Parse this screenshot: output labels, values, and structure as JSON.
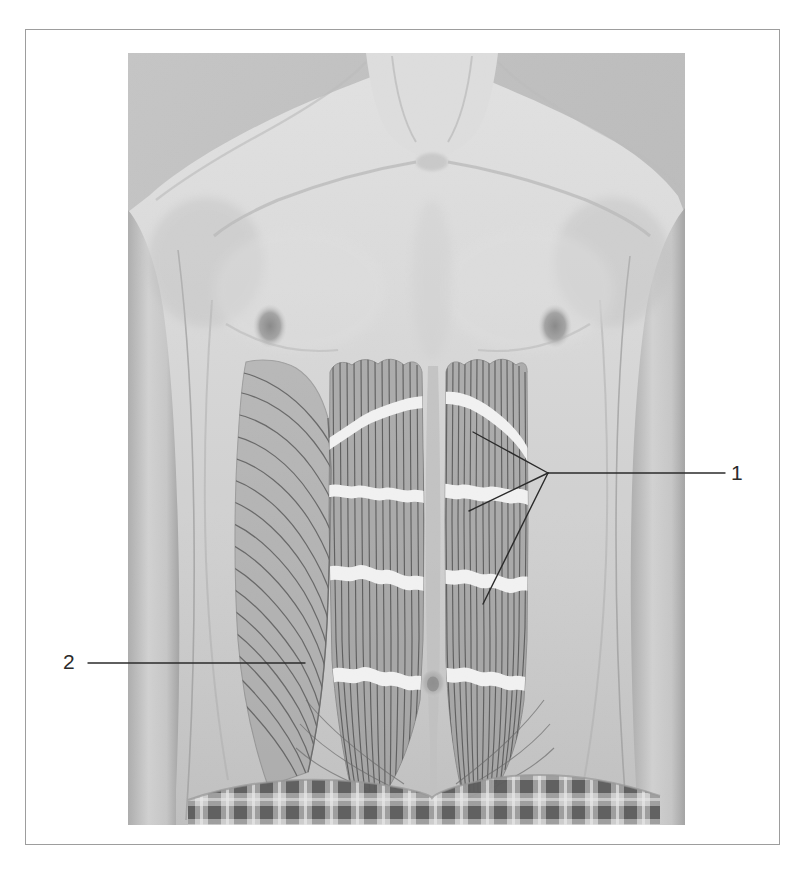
{
  "page": {
    "kind": "anatomy-figure-plate",
    "background_color": "#ffffff",
    "border_color": "#9a9a9a",
    "border": {
      "x": 25,
      "y": 29,
      "width": 755,
      "height": 816
    }
  },
  "photo": {
    "description": "grayscale front view photograph of a male torso from neck to hips",
    "x": 128,
    "y": 53,
    "width": 557,
    "height": 772,
    "background_color": "#c3c3c3",
    "skin_light": "#dcdcdc",
    "skin_mid": "#c8c8c8",
    "skin_shadow": "#a9a9a9",
    "features": [
      {
        "name": "neck",
        "label": "neck"
      },
      {
        "name": "clavicle-left",
        "label": "clavicle"
      },
      {
        "name": "clavicle-right",
        "label": "clavicle"
      },
      {
        "name": "nipple-left",
        "label": "nipple",
        "x": 270,
        "y": 325
      },
      {
        "name": "nipple-right",
        "label": "nipple",
        "x": 555,
        "y": 325
      },
      {
        "name": "umbilicus",
        "label": "navel",
        "x": 432,
        "y": 683
      },
      {
        "name": "plaid-waistband",
        "label": "plaid shorts waistband"
      }
    ]
  },
  "overlay": {
    "muscle_fill": "#9a9a9a",
    "muscle_fill_soft": "#a3a3a3",
    "striation_color": "#5e5e5e",
    "tendon_color": "#f4f4f4",
    "linea_alba_color": "#bdbdbd",
    "rectus_left": {
      "x": 326,
      "y": 362,
      "width": 96,
      "height": 430
    },
    "rectus_right": {
      "x": 443,
      "y": 360,
      "width": 84,
      "height": 430
    },
    "oblique": {
      "x": 232,
      "y": 358,
      "width": 110,
      "height": 420
    },
    "tendinous_intersections": 4,
    "striation_count_rectus": 14,
    "fiber_count_oblique": 16
  },
  "labels": [
    {
      "id": "1",
      "text": "1",
      "x": 737,
      "y": 474,
      "refers_to": "rectus abdominis",
      "leader": {
        "type": "multi-branch",
        "color": "#2b2b2b",
        "width": 1.4,
        "anchor": {
          "x": 725,
          "y": 473
        },
        "hub": {
          "x": 548,
          "y": 473
        },
        "branches": [
          {
            "x": 473,
            "y": 432
          },
          {
            "x": 469,
            "y": 511
          },
          {
            "x": 483,
            "y": 604
          }
        ]
      }
    },
    {
      "id": "2",
      "text": "2",
      "x": 70,
      "y": 663,
      "refers_to": "external oblique",
      "leader": {
        "type": "straight",
        "color": "#2b2b2b",
        "width": 1.4,
        "anchor": {
          "x": 88,
          "y": 663
        },
        "end": {
          "x": 305,
          "y": 663
        }
      }
    }
  ]
}
